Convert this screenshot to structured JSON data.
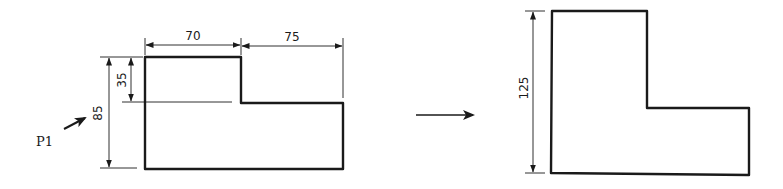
{
  "diagram": {
    "type": "engineering-drawing-transformation",
    "left_figure": {
      "label": "P1",
      "dimensions": {
        "top_left_width": "70",
        "top_right_width": "75",
        "step_height": "35",
        "total_height": "85"
      }
    },
    "transform_arrow": "→",
    "right_figure": {
      "dimensions": {
        "total_height": "125"
      }
    },
    "colors": {
      "stroke": "#1a1a1a",
      "background": "#ffffff"
    }
  }
}
